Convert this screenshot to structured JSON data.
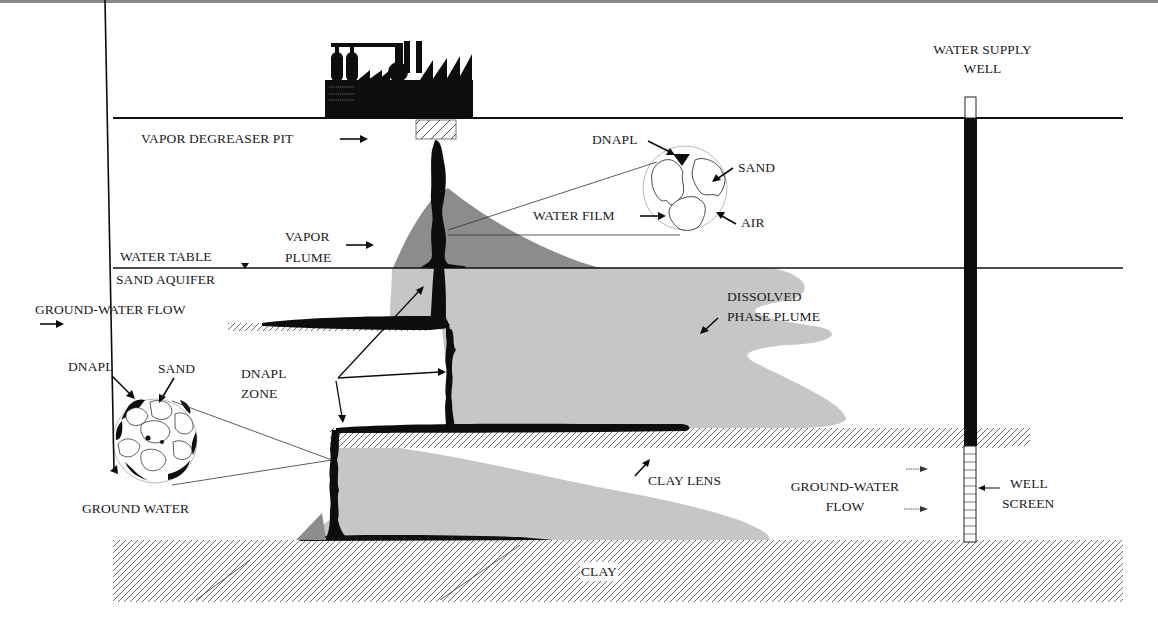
{
  "diagram": {
    "type": "geologic-cross-section",
    "colors": {
      "dnapl": "#0d0d0d",
      "vapor_plume": "#8c8c8c",
      "dissolved_plume": "#c6c6c6",
      "hatch": "#6e6e6e",
      "ground_line": "#111111",
      "background": "#ffffff"
    },
    "labels": {
      "water_supply_well": [
        "WATER SUPPLY",
        "WELL"
      ],
      "vapor_degreaser_pit": "VAPOR DEGREASER PIT",
      "dnapl_top": "DNAPL",
      "sand_top": "SAND",
      "water_film": "WATER FILM",
      "air": "AIR",
      "vapor_plume": [
        "VAPOR",
        "PLUME"
      ],
      "water_table": "WATER TABLE",
      "sand_aquifer": "SAND  AQUIFER",
      "ground_water_flow_top": "GROUND-WATER FLOW",
      "dissolved_phase_plume": [
        "DISSOLVED",
        "PHASE PLUME"
      ],
      "dnapl_left": "DNAPL",
      "sand_left": "SAND",
      "dnapl_zone": [
        "DNAPL",
        "ZONE"
      ],
      "ground_water": "GROUND WATER",
      "clay_lens": "CLAY LENS",
      "ground_water_flow_bottom": [
        "GROUND-WATER",
        "FLOW"
      ],
      "well_screen": [
        "WELL",
        "SCREEN"
      ],
      "clay": "CLAY"
    },
    "layers": [
      {
        "name": "Unsaturated zone",
        "y_top": 118,
        "y_bottom": 268
      },
      {
        "name": "Sand aquifer",
        "y_top": 268,
        "y_bottom": 540
      },
      {
        "name": "Clay lens",
        "y_top": 428,
        "y_bottom": 448
      },
      {
        "name": "Clay",
        "y_top": 540,
        "y_bottom": 602
      }
    ]
  }
}
